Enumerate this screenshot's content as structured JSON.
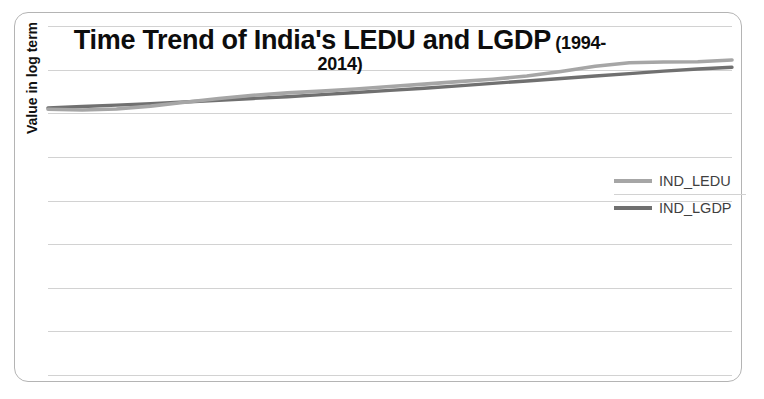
{
  "chart_data": {
    "type": "line",
    "title": "Time Trend of India's LEDU and LGDP",
    "title_suffix": "(1994-2014)",
    "xlabel": "",
    "ylabel": "Value in log term",
    "grid": true,
    "grid_axis": "y",
    "gridline_count": 9,
    "legend_position": "right",
    "x": [
      1994,
      1995,
      1996,
      1997,
      1998,
      1999,
      2000,
      2001,
      2002,
      2003,
      2004,
      2005,
      2006,
      2007,
      2008,
      2009,
      2010,
      2011,
      2012,
      2013,
      2014
    ],
    "xlim": [
      1994,
      2014
    ],
    "ylim": [
      0.0,
      10.0
    ],
    "y_tick_labels": [],
    "x_tick_labels": [],
    "series": [
      {
        "name": "IND_LEDU",
        "color": "#a6a6a6",
        "values": [
          7.62,
          7.6,
          7.63,
          7.71,
          7.82,
          7.93,
          8.02,
          8.09,
          8.14,
          8.2,
          8.27,
          8.34,
          8.41,
          8.48,
          8.57,
          8.7,
          8.85,
          8.95,
          8.97,
          8.98,
          9.03
        ]
      },
      {
        "name": "IND_LGDP",
        "color": "#707070",
        "values": [
          7.66,
          7.7,
          7.74,
          7.78,
          7.83,
          7.88,
          7.93,
          7.98,
          8.04,
          8.1,
          8.16,
          8.22,
          8.29,
          8.36,
          8.43,
          8.5,
          8.57,
          8.64,
          8.71,
          8.77,
          8.82
        ]
      }
    ]
  },
  "legend": {
    "items": [
      {
        "label": "IND_LEDU",
        "color": "#a6a6a6"
      },
      {
        "label": "IND_LGDP",
        "color": "#707070"
      }
    ]
  },
  "colors": {
    "ledu": "#a6a6a6",
    "lgdp": "#707070",
    "gridline": "#d2d2d2",
    "frame": "#b4b4b4",
    "background": "#ffffff",
    "title_text": "#0d0d0d",
    "legend_text": "#3f3f3f"
  }
}
